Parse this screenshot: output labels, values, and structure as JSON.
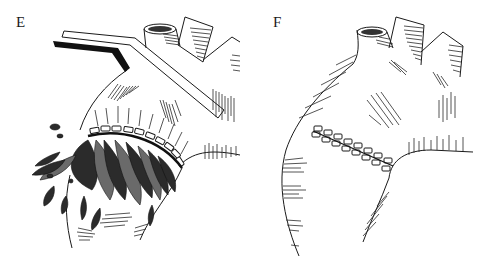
{
  "figure": {
    "panels": [
      {
        "id": "E",
        "label": "E",
        "description": "Aortic root with vascular clamp applied; row of pledgeted sutures along incision with hemorrhage spraying from wound"
      },
      {
        "id": "F",
        "label": "F",
        "description": "Repaired aortic root with completed double row of pledgeted sutures; clamp removed"
      }
    ],
    "colors": {
      "ink": "#1a1a1a",
      "background": "#ffffff",
      "blood": "#2b2b2b"
    },
    "pledget_counts": {
      "E": 11,
      "F": 16
    }
  }
}
